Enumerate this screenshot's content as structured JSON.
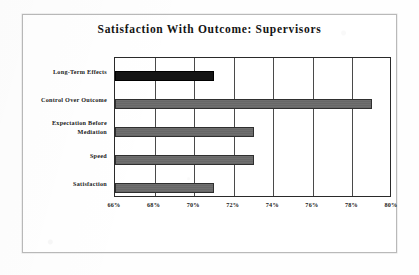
{
  "chart_data": {
    "type": "bar",
    "orientation": "horizontal",
    "title": "Satisfaction With Outcome: Supervisors",
    "xlabel": "",
    "ylabel": "",
    "categories": [
      "Long-Term Effects",
      "Control Over Outcome",
      "Expectation Before Mediation",
      "Speed",
      "Satisfaction"
    ],
    "category_lines": [
      [
        "Long-Term Effects"
      ],
      [
        "Control Over Outcome"
      ],
      [
        "Expectation Before",
        "Mediation"
      ],
      [
        "Speed"
      ],
      [
        "Satisfaction"
      ]
    ],
    "values": [
      71,
      79,
      73,
      73,
      71
    ],
    "value_labels": [
      "71%",
      "79%",
      "73%",
      "73%",
      "71%"
    ],
    "bar_colors": [
      "#151515",
      "#6f6f6f",
      "#6f6f6f",
      "#6f6f6f",
      "#6f6f6f"
    ],
    "xlim": [
      66,
      80
    ],
    "xticks": [
      66,
      68,
      70,
      72,
      74,
      76,
      78,
      80
    ],
    "xtick_labels": [
      "66%",
      "68%",
      "70%",
      "72%",
      "74%",
      "76%",
      "78%",
      "80%"
    ],
    "grid": true,
    "grid_axis": "x",
    "legend": null,
    "legend_position": "none",
    "axis_color": "#2a2a2a",
    "grid_color": "#4a4a4a",
    "plot_background": "#ffffff",
    "frame_background": "#ffffff",
    "frame_border_color": "#b9b9b9"
  }
}
